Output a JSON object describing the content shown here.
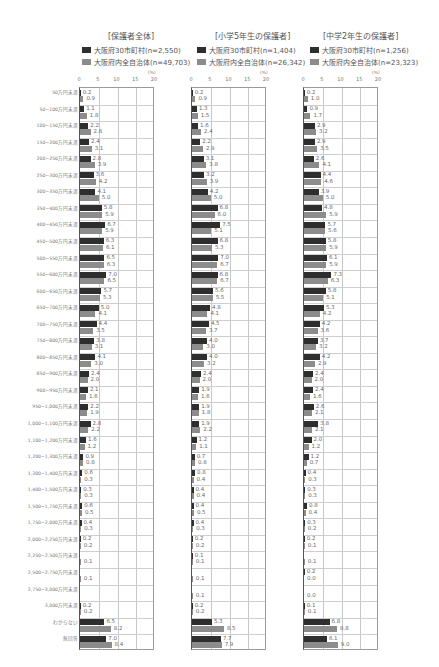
{
  "chart_data": {
    "type": "bar",
    "orientation": "horizontal",
    "unit": "(%)",
    "xlim": [
      0,
      20
    ],
    "xticks": [
      0,
      5,
      10,
      15,
      20
    ],
    "grid": true,
    "categories": [
      "50万円未満",
      "50~100万円未満",
      "100~150万円未満",
      "150~200万円未満",
      "200~250万円未満",
      "250~300万円未満",
      "300~350万円未満",
      "350~400万円未満",
      "400~450万円未満",
      "450~500万円未満",
      "500~550万円未満",
      "550~600万円未満",
      "600~650万円未満",
      "650~700万円未満",
      "700~750万円未満",
      "750~800万円未満",
      "800~850万円未満",
      "850~900万円未満",
      "900~950万円未満",
      "950~1,000万円未満",
      "1,000~1,100万円未満",
      "1,100~1,200万円未満",
      "1,200~1,300万円未満",
      "1,300~1,400万円未満",
      "1,400~1,500万円未満",
      "1,500~1,750万円未満",
      "1,750~2,000万円未満",
      "2,000~2,250万円未満",
      "2,250~2,500万円未満",
      "2,500~2,750万円未満",
      "2,750~3,000万円未満",
      "3,000万円未満",
      "わからない",
      "無回答"
    ],
    "panels": [
      {
        "title": "[保護者全体]",
        "series": [
          {
            "name": "大阪府30市町村(n=2,550)",
            "color": "#2e2e2e",
            "values": [
              0.2,
              1.1,
              2.2,
              2.4,
              2.8,
              3.6,
              4.1,
              5.8,
              6.7,
              6.3,
              6.5,
              7.0,
              5.7,
              5.0,
              4.4,
              3.8,
              4.1,
              2.4,
              2.1,
              2.2,
              2.8,
              1.6,
              0.9,
              0.6,
              0.3,
              0.6,
              0.4,
              0.2,
              null,
              null,
              null,
              0.2,
              6.5,
              7.0
            ]
          },
          {
            "name": "大阪府内全自治体(n=49,703)",
            "color": "#8c8c8c",
            "values": [
              0.9,
              1.8,
              2.8,
              3.1,
              3.9,
              4.2,
              5.0,
              5.9,
              5.9,
              6.1,
              6.3,
              6.5,
              5.3,
              4.1,
              3.5,
              3.1,
              3.0,
              2.0,
              1.6,
              1.9,
              2.2,
              1.2,
              0.8,
              0.3,
              0.3,
              0.5,
              0.3,
              0.2,
              0.1,
              0.1,
              null,
              0.2,
              8.2,
              8.4
            ]
          }
        ]
      },
      {
        "title": "[小学5年生の保護者]",
        "series": [
          {
            "name": "大阪府30市町村(n=1,404)",
            "color": "#2e2e2e",
            "values": [
              0.2,
              1.3,
              1.6,
              2.2,
              3.1,
              3.2,
              4.2,
              6.8,
              7.5,
              6.8,
              7.0,
              6.8,
              5.6,
              4.8,
              4.5,
              4.0,
              4.0,
              2.4,
              1.9,
              1.9,
              1.9,
              1.2,
              0.7,
              0.8,
              0.4,
              0.4,
              0.4,
              0.2,
              0.1,
              null,
              null,
              0.2,
              5.3,
              7.7
            ]
          },
          {
            "name": "大阪府内全自治体(n=26,342)",
            "color": "#8c8c8c",
            "values": [
              0.9,
              1.5,
              2.4,
              2.9,
              3.8,
              3.9,
              5.0,
              6.0,
              5.1,
              5.3,
              6.7,
              6.7,
              5.5,
              4.1,
              3.7,
              3.0,
              3.2,
              2.0,
              1.6,
              1.8,
              2.2,
              1.1,
              0.8,
              0.4,
              0.4,
              0.5,
              0.3,
              0.2,
              0.1,
              0.1,
              0.1,
              0.2,
              8.5,
              7.9
            ]
          }
        ]
      },
      {
        "title": "[中学2年生の保護者]",
        "series": [
          {
            "name": "大阪府30市町村(n=1,256)",
            "color": "#2e2e2e",
            "values": [
              0.2,
              0.9,
              2.9,
              2.9,
              2.6,
              4.4,
              3.9,
              4.8,
              5.7,
              5.8,
              6.1,
              7.3,
              5.8,
              5.3,
              4.2,
              3.7,
              4.2,
              2.4,
              2.4,
              2.6,
              3.8,
              2.0,
              1.2,
              0.4,
              0.3,
              0.8,
              0.3,
              0.2,
              null,
              0.2,
              null,
              0.1,
              6.8,
              6.1
            ]
          },
          {
            "name": "大阪府内全自治体(n=23,323)",
            "color": "#8c8c8c",
            "values": [
              1.0,
              1.7,
              3.2,
              3.5,
              4.1,
              4.6,
              5.0,
              5.9,
              5.6,
              5.9,
              5.9,
              6.3,
              5.1,
              4.2,
              3.6,
              3.2,
              2.9,
              2.0,
              1.6,
              2.1,
              2.1,
              1.2,
              0.7,
              0.3,
              0.3,
              0.4,
              0.2,
              0.1,
              0.1,
              0.0,
              0.0,
              0.1,
              8.8,
              9.0
            ]
          }
        ]
      }
    ]
  },
  "panels": [
    {
      "title": "[保護者全体]",
      "legend_dark": "大阪府30市町村(n=2,550)",
      "legend_gray": "大阪府内全自治体(n=49,703)"
    },
    {
      "title": "[小学5年生の保護者]",
      "legend_dark": "大阪府30市町村(n=1,404)",
      "legend_gray": "大阪府内全自治体(n=26,342)"
    },
    {
      "title": "[中学2年生の保護者]",
      "legend_dark": "大阪府30市町村(n=1,256)",
      "legend_gray": "大阪府内全自治体(n=23,323)"
    }
  ],
  "axis": {
    "unit": "(%)",
    "ticks": [
      "0",
      "5",
      "10",
      "15",
      "20"
    ]
  }
}
